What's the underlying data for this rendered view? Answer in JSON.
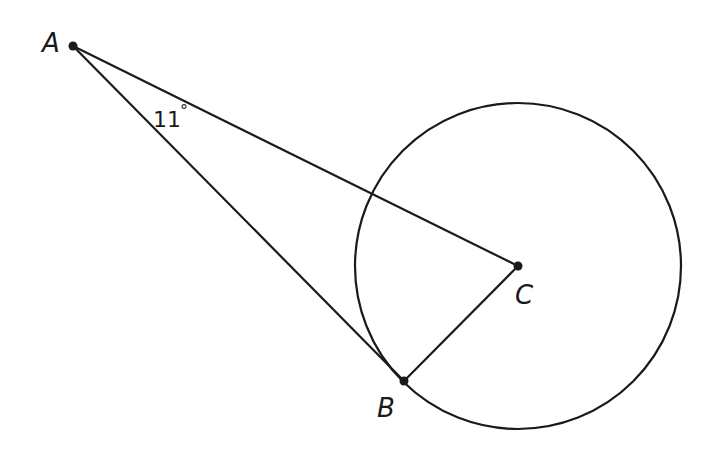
{
  "diagram": {
    "type": "geometry",
    "points": {
      "A": {
        "label": "A",
        "x": 73,
        "y": 46
      },
      "B": {
        "label": "B",
        "x": 404,
        "y": 381
      },
      "C": {
        "label": "C",
        "x": 518,
        "y": 266
      }
    },
    "circle": {
      "center": "C",
      "cx": 518,
      "cy": 266,
      "r": 163
    },
    "segments": [
      {
        "from": "A",
        "to": "C"
      },
      {
        "from": "A",
        "to": "B"
      },
      {
        "from": "B",
        "to": "C"
      }
    ],
    "angle_mark": {
      "vertex": "A",
      "value": "11°",
      "text": "11",
      "degree": "°"
    },
    "stroke_color": "#1a1a1a",
    "background": "#ffffff"
  }
}
